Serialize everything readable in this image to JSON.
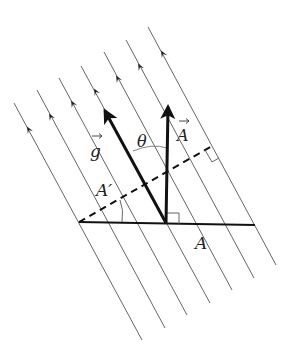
{
  "diagram": {
    "type": "vector field flux diagram",
    "field_lines": {
      "count": 7,
      "color": "#555555",
      "lines": [
        {
          "x1": 14,
          "y1": 103,
          "x2": 142,
          "y2": 340,
          "arrow": [
            29,
            130
          ]
        },
        {
          "x1": 37,
          "y1": 90,
          "x2": 165,
          "y2": 328,
          "arrow": [
            51,
            117
          ]
        },
        {
          "x1": 59,
          "y1": 78,
          "x2": 187,
          "y2": 315,
          "arrow": [
            73,
            104
          ]
        },
        {
          "x1": 81,
          "y1": 66,
          "x2": 210,
          "y2": 303,
          "arrow": [
            96,
            92
          ]
        },
        {
          "x1": 104,
          "y1": 52,
          "x2": 232,
          "y2": 290,
          "arrow": [
            118,
            79
          ]
        },
        {
          "x1": 126,
          "y1": 40,
          "x2": 254,
          "y2": 278,
          "arrow": [
            140,
            67
          ]
        },
        {
          "x1": 148,
          "y1": 27,
          "x2": 276,
          "y2": 265,
          "arrow": [
            163,
            54
          ]
        }
      ]
    },
    "vectors": {
      "g": {
        "label": "g",
        "from": [
          166,
          223
        ],
        "to": [
          103,
          107
        ]
      },
      "A": {
        "label": "A",
        "from": [
          166,
          223
        ],
        "to": [
          168,
          103
        ]
      }
    },
    "labels": {
      "g_vec": "g",
      "A_vec": "A",
      "theta": "θ",
      "A_prime": "A′",
      "A_area": "A"
    }
  }
}
